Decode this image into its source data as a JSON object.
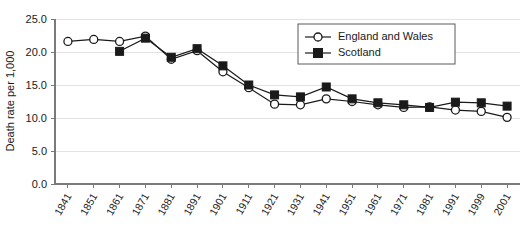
{
  "chart_data": {
    "type": "line",
    "title": "",
    "xlabel": "",
    "ylabel": "Death rate per 1,000",
    "ylim": [
      0,
      25
    ],
    "yticks": [
      "0.0",
      "5.0",
      "10.0",
      "15.0",
      "20.0",
      "25.0"
    ],
    "ytick_values": [
      0,
      5,
      10,
      15,
      20,
      25
    ],
    "grid": true,
    "legend_position": "top-right",
    "categories": [
      "1841",
      "1851",
      "1861",
      "1871",
      "1881",
      "1891",
      "1901",
      "1911",
      "1921",
      "1931",
      "1941",
      "1951",
      "1961",
      "1971",
      "1981",
      "1991",
      "1999",
      "2001"
    ],
    "series": [
      {
        "name": "England and Wales",
        "marker": "open-circle",
        "values": [
          21.6,
          21.9,
          21.6,
          22.4,
          18.9,
          20.2,
          17.0,
          14.6,
          12.1,
          12.0,
          12.9,
          12.5,
          12.0,
          11.6,
          11.7,
          11.2,
          11.0,
          10.1
        ]
      },
      {
        "name": "Scotland",
        "marker": "filled-square",
        "values": [
          null,
          null,
          20.1,
          22.1,
          19.2,
          20.5,
          17.9,
          15.0,
          13.5,
          13.2,
          14.7,
          12.9,
          12.3,
          12.0,
          11.6,
          12.4,
          12.3,
          11.8
        ]
      }
    ]
  },
  "legend": {
    "entries": [
      {
        "label": "England and Wales"
      },
      {
        "label": "Scotland"
      }
    ]
  },
  "axes": {
    "y_title": "Death rate per 1,000"
  }
}
